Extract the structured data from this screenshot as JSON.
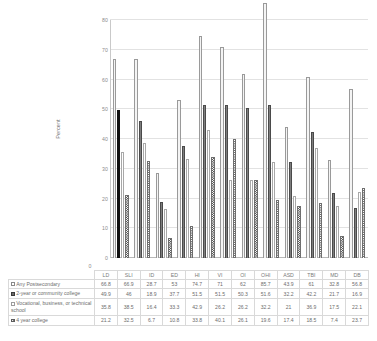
{
  "chart_data": {
    "type": "bar",
    "title": "",
    "xlabel": "",
    "ylabel": "Percent",
    "ylim": [
      0,
      80
    ],
    "yticks": [
      0,
      10,
      20,
      30,
      40,
      50,
      60,
      70,
      80
    ],
    "grid": true,
    "legend_position": "data-table-below",
    "categories": [
      "LD",
      "SLI",
      "ID",
      "ED",
      "HI",
      "VI",
      "OI",
      "OHI",
      "ASD",
      "TBI",
      "MD",
      "DB"
    ],
    "series": [
      {
        "name": "Any Postsecondary",
        "marker": "hollow-square",
        "values": [
          66.8,
          66.9,
          28.7,
          53,
          74.7,
          71,
          62,
          85.7,
          43.9,
          61,
          32.8,
          56.8
        ]
      },
      {
        "name": "2-year or community college",
        "marker": "filled-square",
        "values": [
          49.9,
          46,
          18.9,
          37.7,
          51.5,
          51.5,
          50.3,
          51.6,
          32.2,
          42.2,
          21.7,
          16.9
        ]
      },
      {
        "name": "Vocational, business, or technical school",
        "marker": "hollow-square",
        "values": [
          35.8,
          38.5,
          16.4,
          33.3,
          42.9,
          26.2,
          26.2,
          32.2,
          21,
          36.9,
          17.5,
          22.1
        ]
      },
      {
        "name": "4 year college",
        "marker": "checkered-square",
        "values": [
          21.2,
          32.5,
          6.7,
          10.8,
          33.8,
          40.1,
          26.1,
          19.6,
          17.4,
          18.5,
          7.4,
          23.7
        ]
      }
    ],
    "axis_origin_label": "0"
  }
}
